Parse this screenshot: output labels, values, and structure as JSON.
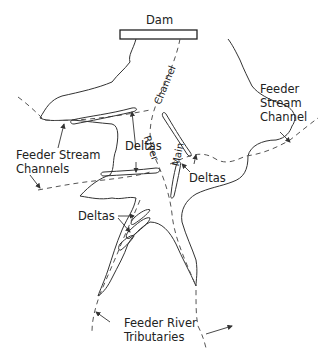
{
  "diagram": {
    "type": "reservoir-map",
    "labels": {
      "dam": "Dam",
      "channel": "Channel",
      "river": "River",
      "main": "Main",
      "feeder_stream_channel_right_1": "Feeder",
      "feeder_stream_channel_right_2": "Stream",
      "feeder_stream_channel_right_3": "Channel",
      "feeder_stream_channels_left_1": "Feeder Stream",
      "feeder_stream_channels_left_2": "Channels",
      "deltas_center": "Deltas",
      "deltas_right": "Deltas",
      "deltas_lower": "Deltas",
      "feeder_river_tributaries_1": "Feeder River",
      "feeder_river_tributaries_2": "Tributaries"
    },
    "colors": {
      "line": "#333333",
      "dash": "#666666",
      "background": "#ffffff"
    }
  }
}
